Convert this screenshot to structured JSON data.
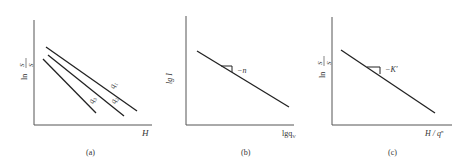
{
  "panels": [
    {
      "id": "a",
      "caption": "(a)",
      "ylabel": {
        "prefix": "ln",
        "num": "S",
        "num_sub": "r",
        "den": "S",
        "den_sub": "i"
      },
      "xlabel": "H",
      "lines": [
        {
          "label": "q",
          "sub": "1"
        },
        {
          "label": "q",
          "sub": "2"
        },
        {
          "label": "q",
          "sub": "3"
        }
      ]
    },
    {
      "id": "b",
      "caption": "(b)",
      "ylabel": "lg I",
      "xlabel": "lgq",
      "xlabel_sub": "V",
      "slope_label": "−n"
    },
    {
      "id": "c",
      "caption": "(c)",
      "ylabel": {
        "prefix": "ln",
        "num": "S",
        "num_sub": "r",
        "den": "S",
        "den_sub": "i"
      },
      "xlabel": "H / q",
      "xlabel_sub": "V",
      "xlabel_sup": "n",
      "slope_label": "−K′"
    }
  ],
  "colors": {
    "axis": "#555555",
    "line": "#222222",
    "text": "#333333"
  }
}
